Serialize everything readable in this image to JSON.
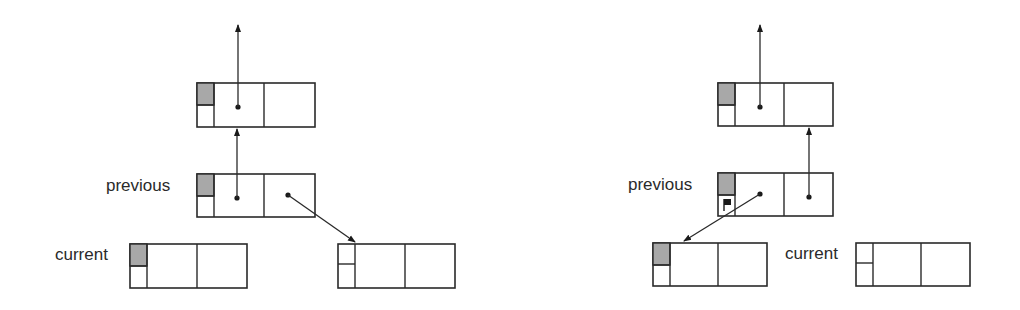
{
  "colors": {
    "stroke": "#2a2a2a",
    "shade": "#a8a8a8",
    "background": "#ffffff"
  },
  "left_diagram": {
    "labels": {
      "previous": "previous",
      "current": "current"
    },
    "nodes": [
      {
        "id": "top",
        "x": 197,
        "y": 83,
        "w": 118,
        "h": 44,
        "shaded": true,
        "flag": false
      },
      {
        "id": "previous",
        "x": 197,
        "y": 174,
        "w": 118,
        "h": 43,
        "shaded": true,
        "flag": false
      },
      {
        "id": "current",
        "x": 130,
        "y": 244,
        "w": 117,
        "h": 44,
        "shaded": true,
        "flag": false
      },
      {
        "id": "new",
        "x": 338,
        "y": 244,
        "w": 117,
        "h": 44,
        "shaded": false,
        "flag": false
      }
    ]
  },
  "right_diagram": {
    "labels": {
      "previous": "previous",
      "current": "current"
    },
    "nodes": [
      {
        "id": "top",
        "x": 718,
        "y": 83,
        "w": 115,
        "h": 43,
        "shaded": true,
        "flag": false
      },
      {
        "id": "previous",
        "x": 718,
        "y": 173,
        "w": 115,
        "h": 43,
        "shaded": true,
        "flag": true
      },
      {
        "id": "left-child",
        "x": 653,
        "y": 243,
        "w": 114,
        "h": 43,
        "shaded": true,
        "flag": false
      },
      {
        "id": "current",
        "x": 856,
        "y": 243,
        "w": 114,
        "h": 43,
        "shaded": false,
        "flag": false
      }
    ]
  }
}
